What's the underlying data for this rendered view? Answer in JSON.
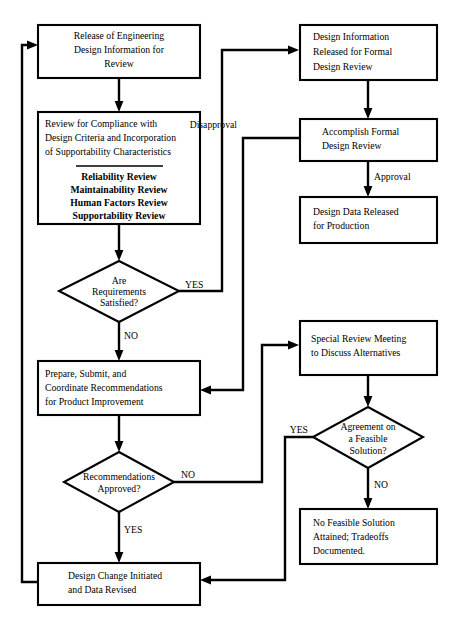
{
  "diagram": {
    "type": "flowchart",
    "nodes": [
      {
        "id": "release-engineering",
        "shape": "process",
        "lines": [
          "Release of Engineering",
          "Design Information for",
          "Review"
        ]
      },
      {
        "id": "review-compliance",
        "shape": "process",
        "lines": [
          "Review for Compliance with",
          "Design Criteria and Incorporation",
          "of Supportability Characteristics"
        ],
        "sublist": [
          "Reliability Review",
          "Maintainability Review",
          "Human Factors Review",
          "Supportability Review"
        ]
      },
      {
        "id": "requirements-satisfied",
        "shape": "decision",
        "lines": [
          "Are",
          "Requirements",
          "Satisfied?"
        ]
      },
      {
        "id": "prepare-submit",
        "shape": "process",
        "lines": [
          "Prepare, Submit, and",
          "Coordinate Recommendations",
          "for Product Improvement"
        ]
      },
      {
        "id": "recommendations-approved",
        "shape": "decision",
        "lines": [
          "Recommendations",
          "Approved?"
        ]
      },
      {
        "id": "design-change-initiated",
        "shape": "process",
        "lines": [
          "Design Change Initiated",
          "and Data Revised"
        ]
      },
      {
        "id": "design-information-released",
        "shape": "process",
        "lines": [
          "Design Information",
          "Released for Formal",
          "Design Review"
        ]
      },
      {
        "id": "accomplish-formal-review",
        "shape": "process",
        "lines": [
          "Accomplish Formal",
          "Design Review"
        ]
      },
      {
        "id": "design-data-released",
        "shape": "process",
        "lines": [
          "Design Data Released",
          "for Production"
        ]
      },
      {
        "id": "special-review-meeting",
        "shape": "process",
        "lines": [
          "Special Review Meeting",
          "to Discuss Alternatives"
        ]
      },
      {
        "id": "agreement-feasible",
        "shape": "decision",
        "lines": [
          "Agreement on",
          "a Feasible",
          "Solution?"
        ]
      },
      {
        "id": "no-feasible-solution",
        "shape": "process",
        "lines": [
          "No Feasible Solution",
          "Attained; Tradeoffs",
          "Documented."
        ]
      }
    ],
    "edge_labels": {
      "requirements_yes": "YES",
      "requirements_no": "NO",
      "recommendations_no": "NO",
      "recommendations_yes": "YES",
      "formal_review_disapproval": "Disapproval",
      "formal_review_approval": "Approval",
      "agreement_yes": "YES",
      "agreement_no": "NO"
    },
    "colors": {
      "stroke": "#000000",
      "fill": "#ffffff",
      "text": "#000000"
    }
  }
}
